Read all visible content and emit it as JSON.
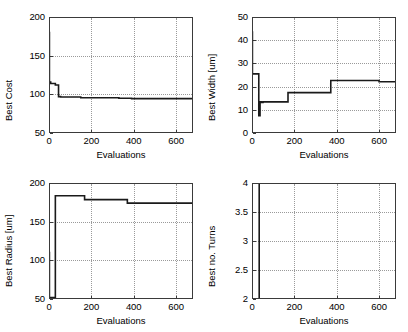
{
  "figure": {
    "background": "#ffffff",
    "line_color": "#1a1a1a",
    "axis_color": "#3a3a3a",
    "grid_color": "#9a9a9a"
  },
  "chart_data": [
    {
      "id": "best-cost",
      "type": "line",
      "title": "",
      "xlabel": "Evaluations",
      "ylabel": "Best Cost",
      "xlim": [
        0,
        680
      ],
      "ylim": [
        50,
        200
      ],
      "xticks": [
        0,
        200,
        400,
        600
      ],
      "xticklabels": [
        "0",
        "200",
        "400",
        "600"
      ],
      "yticks": [
        50,
        100,
        150,
        200
      ],
      "yticklabels": [
        "50",
        "100",
        "150",
        "200"
      ],
      "grid": true,
      "legend": null,
      "series": [
        {
          "name": "Best Cost",
          "x": [
            0,
            2,
            2,
            8,
            8,
            30,
            30,
            45,
            45,
            55,
            55,
            150,
            150,
            330,
            330,
            390,
            390,
            680
          ],
          "y": [
            180,
            180,
            116,
            116,
            114,
            114,
            112,
            112,
            97,
            97,
            96.5,
            96.5,
            95.5,
            95.5,
            95,
            95,
            94.5,
            94.5
          ]
        }
      ]
    },
    {
      "id": "best-width",
      "type": "line",
      "title": "",
      "xlabel": "Evaluations",
      "ylabel": "Best Width  [um]",
      "xlim": [
        0,
        680
      ],
      "ylim": [
        0,
        50
      ],
      "xticks": [
        0,
        200,
        400,
        600
      ],
      "xticklabels": [
        "0",
        "200",
        "400",
        "600"
      ],
      "yticks": [
        0,
        10,
        20,
        30,
        40,
        50
      ],
      "yticklabels": [
        "0",
        "10",
        "20",
        "30",
        "40",
        "50"
      ],
      "grid": true,
      "legend": null,
      "series": [
        {
          "name": "Best Width",
          "x": [
            0,
            2,
            2,
            32,
            32,
            38,
            38,
            44,
            44,
            52,
            52,
            170,
            170,
            372,
            372,
            600,
            600,
            680
          ],
          "y": [
            43.5,
            43.5,
            25.5,
            25.5,
            7.5,
            7.5,
            13.5,
            13.5,
            13.2,
            13.2,
            13.4,
            13.4,
            17.4,
            17.4,
            22.6,
            22.6,
            22.1,
            22.1
          ]
        }
      ]
    },
    {
      "id": "best-radius",
      "type": "line",
      "title": "",
      "xlabel": "Evaluations",
      "ylabel": "Best Radius [um]",
      "xlim": [
        0,
        680
      ],
      "ylim": [
        50,
        200
      ],
      "xticks": [
        0,
        200,
        400,
        600
      ],
      "xticklabels": [
        "0",
        "200",
        "400",
        "600"
      ],
      "yticks": [
        50,
        100,
        150,
        200
      ],
      "yticklabels": [
        "50",
        "100",
        "150",
        "200"
      ],
      "grid": true,
      "legend": null,
      "series": [
        {
          "name": "Best Radius",
          "x": [
            0,
            2,
            2,
            30,
            30,
            40,
            40,
            168,
            168,
            370,
            370,
            680
          ],
          "y": [
            110,
            110,
            52,
            52,
            183.5,
            183.5,
            183.5,
            183.5,
            178.5,
            178.5,
            174,
            174
          ]
        }
      ]
    },
    {
      "id": "best-no-turns",
      "type": "line",
      "title": "",
      "xlabel": "Evaluations",
      "ylabel": "Best no. Turns",
      "xlim": [
        0,
        680
      ],
      "ylim": [
        2,
        4
      ],
      "xticks": [
        0,
        200,
        400,
        600
      ],
      "xticklabels": [
        "0",
        "200",
        "400",
        "600"
      ],
      "yticks": [
        2,
        2.5,
        3,
        3.5,
        4
      ],
      "yticklabels": [
        "2",
        "2.5",
        "3",
        "3.5",
        "4"
      ],
      "grid": true,
      "legend": null,
      "series": [
        {
          "name": "Best no. Turns",
          "x": [
            0,
            34,
            34,
            680
          ],
          "y": [
            4,
            4,
            2,
            2
          ]
        }
      ]
    }
  ]
}
